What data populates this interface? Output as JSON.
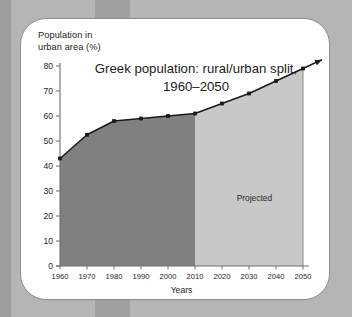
{
  "card": {
    "y_axis_label": "Population in\nurban area (%)"
  },
  "chart_data": {
    "type": "area",
    "title": "Greek population: rural/urban split,",
    "title_line2": "1960–2050",
    "xlabel": "Years",
    "ylabel": "Population in urban area (%)",
    "categories": [
      "1960",
      "1970",
      "1980",
      "1990",
      "2000",
      "2010",
      "2020",
      "2030",
      "2040",
      "2050"
    ],
    "values": [
      43,
      52.5,
      58,
      59,
      60,
      61,
      65,
      69,
      74,
      79
    ],
    "xlim": [
      1960,
      2050
    ],
    "ylim": [
      0,
      80
    ],
    "yticks": [
      "0",
      "10",
      "20",
      "30",
      "40",
      "50",
      "60",
      "70",
      "80"
    ],
    "grid": false,
    "legend": "none",
    "annotations": [
      {
        "label": "Projected",
        "x": 2032,
        "y": 26
      }
    ],
    "regions": [
      {
        "name": "historical",
        "from": "1960",
        "to": "2010",
        "color": "#808080"
      },
      {
        "name": "projected",
        "from": "2010",
        "to": "2050",
        "color": "#c8c8c8"
      }
    ],
    "line_color": "#1a1a1a",
    "marker": "square",
    "arrow_beyond_last_point": true,
    "colors": {
      "historical_fill": "#808080",
      "projected_fill": "#c8c8c8",
      "line": "#1a1a1a",
      "card_background": "#ffffff",
      "page_background": "#b5b5b5"
    }
  }
}
